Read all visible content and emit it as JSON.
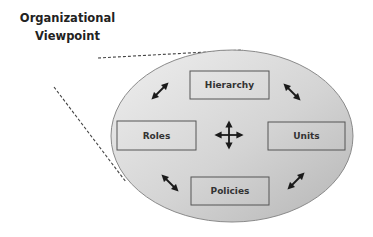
{
  "diagram": {
    "title_line1": "Organizational",
    "title_line2": "Viewpoint",
    "nodes": [
      {
        "id": "hierarchy",
        "label": "Hierarchy",
        "x": 190,
        "y": 71,
        "w": 79,
        "h": 28
      },
      {
        "id": "roles",
        "label": "Roles",
        "x": 117,
        "y": 121,
        "w": 79,
        "h": 29
      },
      {
        "id": "units",
        "label": "Units",
        "x": 268,
        "y": 122,
        "w": 77,
        "h": 28
      },
      {
        "id": "policies",
        "label": "Policies",
        "x": 191,
        "y": 177,
        "w": 78,
        "h": 28
      }
    ],
    "container": {
      "shape": "ellipse",
      "cx": 232,
      "cy": 136,
      "rx": 121,
      "ry": 86
    },
    "connectors": [
      {
        "type": "dashed-line",
        "from": [
          98,
          58
        ],
        "to": [
          243,
          50
        ]
      },
      {
        "type": "dashed-line",
        "from": [
          54,
          87
        ],
        "to": [
          126,
          182
        ]
      }
    ],
    "arrows": [
      {
        "type": "double-arrow",
        "cx": 160,
        "cy": 91,
        "angle": -45
      },
      {
        "type": "double-arrow",
        "cx": 292,
        "cy": 92,
        "angle": 45
      },
      {
        "type": "double-arrow",
        "cx": 170,
        "cy": 183,
        "angle": 45
      },
      {
        "type": "double-arrow",
        "cx": 296,
        "cy": 181,
        "angle": -45
      },
      {
        "type": "four-way-arrow",
        "cx": 229,
        "cy": 135
      }
    ],
    "colors": {
      "ellipse_fill_light": "#ececec",
      "ellipse_fill_dark": "#bdbdbd",
      "ellipse_stroke": "#8a8a8a",
      "box_stroke": "#555555",
      "text": "#333333",
      "arrow": "#1a1a1a",
      "dash": "#444444"
    }
  }
}
